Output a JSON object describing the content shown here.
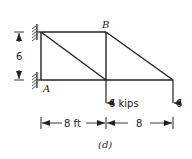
{
  "figure": {
    "caption": "(d)",
    "joints": {
      "top_left": {
        "label": "",
        "x": 41,
        "y": 32
      },
      "A": {
        "label": "A",
        "x": 41,
        "y": 80
      },
      "B": {
        "label": "B",
        "x": 106,
        "y": 32
      },
      "bottom_middle": {
        "label": "",
        "x": 106,
        "y": 80
      },
      "right_end": {
        "label": "",
        "x": 173,
        "y": 80
      }
    },
    "members": [
      {
        "from": "top_left",
        "to": "B"
      },
      {
        "from": "A",
        "to": "right_end"
      },
      {
        "from": "top_left",
        "to": "A"
      },
      {
        "from": "B",
        "to": "bottom_middle"
      },
      {
        "from": "top_left",
        "to": "bottom_middle"
      },
      {
        "from": "B",
        "to": "right_end"
      }
    ],
    "loads": [
      {
        "at": "bottom_middle",
        "label": "6 kips"
      },
      {
        "at": "right_end",
        "label": "6"
      }
    ],
    "dimensions": {
      "vertical": "6",
      "horizontal_left": "8 ft",
      "horizontal_right": "8"
    },
    "supports": [
      "top_left",
      "A"
    ]
  }
}
